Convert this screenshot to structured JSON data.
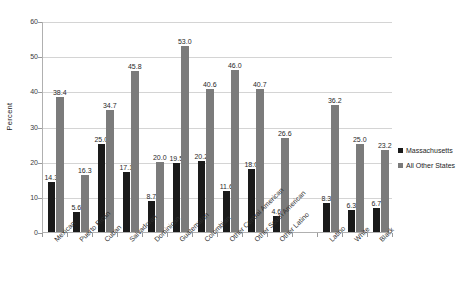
{
  "chart_data": {
    "type": "bar",
    "title": "",
    "subtitle": "",
    "xlabel": "",
    "ylabel": "Percent",
    "ylim": [
      0,
      60
    ],
    "ytick_step": 10,
    "yticks": [
      0,
      10,
      20,
      30,
      40,
      50,
      60
    ],
    "grid": true,
    "legend_position": "right",
    "orientation": "vertical",
    "categories": [
      "Mexican",
      "Puerto Rican",
      "Cuban",
      "Salvadoran",
      "Dominican",
      "Guatemalan",
      "Colombian",
      "Other Central American",
      "Other South American",
      "Other Latino",
      "",
      "Latino",
      "White",
      "Black"
    ],
    "series": [
      {
        "name": "Massachusetts",
        "color": "#1a1a1a",
        "values": [
          14.3,
          5.6,
          25.0,
          17.1,
          8.7,
          19.5,
          20.2,
          11.6,
          18.0,
          4.6,
          null,
          8.3,
          6.3,
          6.7
        ]
      },
      {
        "name": "All Other States",
        "color": "#7b7b7b",
        "values": [
          38.4,
          16.3,
          34.7,
          45.8,
          20.0,
          53.0,
          40.6,
          46.0,
          40.7,
          26.6,
          null,
          36.2,
          25.0,
          23.2
        ]
      }
    ],
    "value_labels": {
      "Massachusetts": [
        "14.3",
        "5.6",
        "25.0",
        "17.1",
        "8.7",
        "19.5",
        "20.2",
        "11.6",
        "18.0",
        "4.6",
        "",
        "8.3",
        "6.3",
        "6.7"
      ],
      "All Other States": [
        "38.4",
        "16.3",
        "34.7",
        "45.8",
        "20.0",
        "53.0",
        "40.6",
        "46.0",
        "40.7",
        "26.6",
        "",
        "36.2",
        "25.0",
        "23.2"
      ]
    }
  },
  "legend": {
    "items": [
      {
        "label": "Massachusetts",
        "color": "#1a1a1a"
      },
      {
        "label": "All Other States",
        "color": "#7b7b7b"
      }
    ]
  },
  "axis": {
    "y_title": "Percent",
    "y_tick_labels": [
      "0",
      "10",
      "20",
      "30",
      "40",
      "50",
      "60"
    ]
  }
}
